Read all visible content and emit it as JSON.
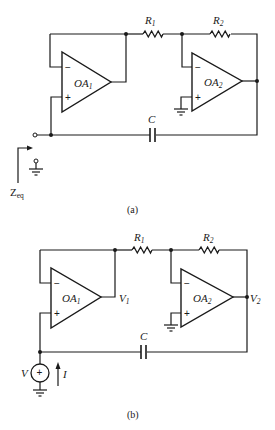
{
  "figure": {
    "panel_a": {
      "caption": "(a)",
      "resistor_1": {
        "label": "R",
        "sub": "1"
      },
      "resistor_2": {
        "label": "R",
        "sub": "2"
      },
      "capacitor": {
        "label": "C"
      },
      "opamp_1": {
        "label": "OA",
        "sub": "1",
        "minus": "−",
        "plus": "+"
      },
      "opamp_2": {
        "label": "OA",
        "sub": "2",
        "minus": "−",
        "plus": "+"
      },
      "port": {
        "label": "Z",
        "sub": "eq"
      }
    },
    "panel_b": {
      "caption": "(b)",
      "resistor_1": {
        "label": "R",
        "sub": "1"
      },
      "resistor_2": {
        "label": "R",
        "sub": "2"
      },
      "capacitor": {
        "label": "C"
      },
      "opamp_1": {
        "label": "OA",
        "sub": "1",
        "minus": "−",
        "plus": "+"
      },
      "opamp_2": {
        "label": "OA",
        "sub": "2",
        "minus": "−",
        "plus": "+"
      },
      "node_v1": {
        "label": "V",
        "sub": "1"
      },
      "node_v2": {
        "label": "V",
        "sub": "2"
      },
      "source": {
        "label": "V",
        "sign": "+"
      },
      "current": {
        "label": "I"
      }
    }
  }
}
